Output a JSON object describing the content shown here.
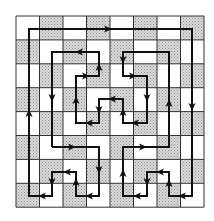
{
  "diagram": {
    "type": "grid-path",
    "grid": {
      "rows": 8,
      "cols": 8,
      "x0": 16,
      "y0": 16,
      "cell_w": 23.5,
      "cell_h": 23.9,
      "pattern": "checkerboard",
      "first_cell_shaded": false,
      "shade_color": "#b8b8b8",
      "line_color": "#333333"
    },
    "path": {
      "color": "#111111",
      "closed": true,
      "points": [
        [
          52,
          147
        ],
        [
          99,
          147
        ],
        [
          99,
          196
        ],
        [
          76,
          196
        ],
        [
          76,
          172
        ],
        [
          52,
          172
        ],
        [
          52,
          196
        ],
        [
          29,
          196
        ],
        [
          29,
          29
        ],
        [
          192,
          29
        ],
        [
          192,
          196
        ],
        [
          169,
          196
        ],
        [
          169,
          172
        ],
        [
          147,
          172
        ],
        [
          147,
          196
        ],
        [
          123,
          196
        ],
        [
          123,
          147
        ],
        [
          169,
          147
        ],
        [
          169,
          52
        ],
        [
          123,
          52
        ],
        [
          123,
          76
        ],
        [
          147,
          76
        ],
        [
          147,
          123
        ],
        [
          123,
          123
        ],
        [
          123,
          99
        ],
        [
          99,
          99
        ],
        [
          99,
          123
        ],
        [
          76,
          123
        ],
        [
          76,
          76
        ],
        [
          99,
          76
        ],
        [
          99,
          52
        ],
        [
          52,
          52
        ]
      ]
    },
    "arrows": [
      {
        "x": 72,
        "y": 147,
        "dir": "right"
      },
      {
        "x": 99,
        "y": 170,
        "dir": "down"
      },
      {
        "x": 89,
        "y": 196,
        "dir": "left"
      },
      {
        "x": 76,
        "y": 182,
        "dir": "up"
      },
      {
        "x": 67,
        "y": 172,
        "dir": "left"
      },
      {
        "x": 52,
        "y": 182,
        "dir": "down"
      },
      {
        "x": 42,
        "y": 196,
        "dir": "left"
      },
      {
        "x": 29,
        "y": 113,
        "dir": "up"
      },
      {
        "x": 108,
        "y": 29,
        "dir": "right"
      },
      {
        "x": 192,
        "y": 107,
        "dir": "down"
      },
      {
        "x": 182,
        "y": 196,
        "dir": "left"
      },
      {
        "x": 169,
        "y": 183,
        "dir": "up"
      },
      {
        "x": 160,
        "y": 172,
        "dir": "left"
      },
      {
        "x": 147,
        "y": 182,
        "dir": "down"
      },
      {
        "x": 137,
        "y": 196,
        "dir": "left"
      },
      {
        "x": 123,
        "y": 173,
        "dir": "up"
      },
      {
        "x": 143,
        "y": 147,
        "dir": "right"
      },
      {
        "x": 169,
        "y": 103,
        "dir": "up"
      },
      {
        "x": 123,
        "y": 60,
        "dir": "down"
      },
      {
        "x": 133,
        "y": 76,
        "dir": "right"
      },
      {
        "x": 147,
        "y": 98,
        "dir": "down"
      },
      {
        "x": 135,
        "y": 123,
        "dir": "left"
      },
      {
        "x": 123,
        "y": 112,
        "dir": "up"
      },
      {
        "x": 112,
        "y": 99,
        "dir": "left"
      },
      {
        "x": 99,
        "y": 110,
        "dir": "down"
      },
      {
        "x": 89,
        "y": 123,
        "dir": "left"
      },
      {
        "x": 76,
        "y": 100,
        "dir": "up"
      },
      {
        "x": 86,
        "y": 76,
        "dir": "right"
      },
      {
        "x": 99,
        "y": 67,
        "dir": "up"
      },
      {
        "x": 79,
        "y": 52,
        "dir": "left"
      },
      {
        "x": 52,
        "y": 98,
        "dir": "down"
      }
    ]
  }
}
